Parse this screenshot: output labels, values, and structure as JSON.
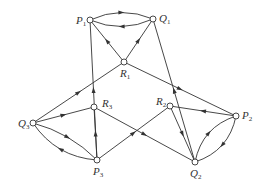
{
  "nodes": [
    {
      "id": "P1",
      "name": "P",
      "sub": "1",
      "x": 90,
      "y": 20,
      "lx": 76,
      "ly": 24
    },
    {
      "id": "Q1",
      "name": "Q",
      "sub": "1",
      "x": 153,
      "y": 19,
      "lx": 159,
      "ly": 22
    },
    {
      "id": "R1",
      "name": "R",
      "sub": "1",
      "x": 124,
      "y": 62,
      "lx": 120,
      "ly": 77
    },
    {
      "id": "Q3",
      "name": "Q",
      "sub": "3",
      "x": 33,
      "y": 123,
      "lx": 18,
      "ly": 127
    },
    {
      "id": "R3",
      "name": "R",
      "sub": "3",
      "x": 94,
      "y": 107,
      "lx": 102,
      "ly": 107
    },
    {
      "id": "P3",
      "name": "P",
      "sub": "3",
      "x": 97,
      "y": 160,
      "lx": 93,
      "ly": 175
    },
    {
      "id": "R2",
      "name": "R",
      "sub": "2",
      "x": 170,
      "y": 106,
      "lx": 156,
      "ly": 105
    },
    {
      "id": "P2",
      "name": "P",
      "sub": "2",
      "x": 236,
      "y": 116,
      "lx": 242,
      "ly": 119
    },
    {
      "id": "Q2",
      "name": "Q",
      "sub": "2",
      "x": 195,
      "y": 162,
      "lx": 190,
      "ly": 177
    }
  ],
  "edges": [
    {
      "from": "P1",
      "to": "Q1",
      "curve": -7
    },
    {
      "from": "Q1",
      "to": "P1",
      "curve": -7
    },
    {
      "from": "R1",
      "to": "P1",
      "curve": 0
    },
    {
      "from": "R1",
      "to": "Q1",
      "curve": 0
    },
    {
      "from": "P3",
      "to": "P1",
      "curve": 0
    },
    {
      "from": "Q2",
      "to": "Q1",
      "curve": 0
    },
    {
      "from": "Q3",
      "to": "R1",
      "curve": 0
    },
    {
      "from": "R1",
      "to": "P2",
      "curve": 0
    },
    {
      "from": "Q3",
      "to": "R3",
      "curve": 0
    },
    {
      "from": "P3",
      "to": "R3",
      "curve": 0
    },
    {
      "from": "Q3",
      "to": "P3",
      "curve": -5
    },
    {
      "from": "P3",
      "to": "Q3",
      "curve": -9
    },
    {
      "from": "R3",
      "to": "Q2",
      "curve": 0
    },
    {
      "from": "P3",
      "to": "R2",
      "curve": 0
    },
    {
      "from": "P2",
      "to": "R2",
      "curve": 0
    },
    {
      "from": "R2",
      "to": "Q2",
      "curve": 0
    },
    {
      "from": "Q2",
      "to": "P2",
      "curve": -9
    },
    {
      "from": "P2",
      "to": "Q2",
      "curve": -9
    }
  ]
}
